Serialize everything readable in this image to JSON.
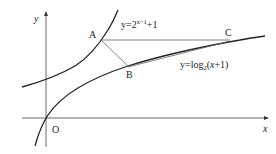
{
  "diagram": {
    "axes": {
      "x_label": "x",
      "y_label": "y",
      "origin_label": "O"
    },
    "curves": [
      {
        "name": "exponential",
        "label_prefix": "y=2",
        "label_exponent": "x−1",
        "label_suffix": "+1"
      },
      {
        "name": "logarithm",
        "label_prefix": "y=log",
        "label_subscript": "2",
        "label_open": "(",
        "label_var": "x",
        "label_suffix": "+1)"
      }
    ],
    "points": {
      "A": "A",
      "B": "B",
      "C": "C"
    },
    "colors": {
      "curve": "#222222",
      "axis": "#444444",
      "segment": "#666666"
    }
  }
}
